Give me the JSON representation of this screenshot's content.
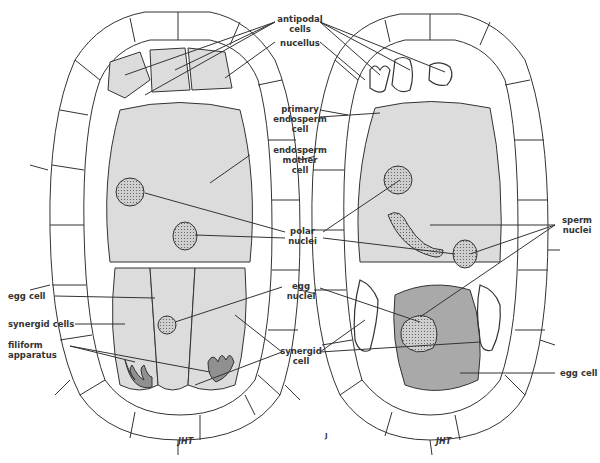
{
  "diagram": {
    "left_panel": {
      "labels": {
        "egg_cell": "egg cell",
        "synergid_cells": "synergid cells",
        "filiform_apparatus_1": "filiform",
        "filiform_apparatus_2": "apparatus"
      }
    },
    "center_labels": {
      "antipodal_1": "antipodal",
      "antipodal_2": "cells",
      "nucellus": "nucellus",
      "primary_1": "primary",
      "primary_2": "endosperm",
      "primary_3": "cell",
      "mother_1": "endosperm",
      "mother_2": "mother",
      "mother_3": "cell",
      "polar_1": "polar",
      "polar_2": "nuclei",
      "eggnuc_1": "egg",
      "eggnuc_2": "nuclei",
      "syn_1": "synergid",
      "syn_2": "cell"
    },
    "right_panel": {
      "labels": {
        "sperm_1": "sperm",
        "sperm_2": "nuclei",
        "egg_cell": "egg cell"
      }
    },
    "signature": "JHT",
    "panel_letter": "J",
    "colors": {
      "cell_fill": "#dcdcdc",
      "nucleus_fill": "#c8c8c8",
      "egg_fertilized": "#a9a9a9",
      "filiform": "#909090",
      "line": "#333333"
    }
  }
}
